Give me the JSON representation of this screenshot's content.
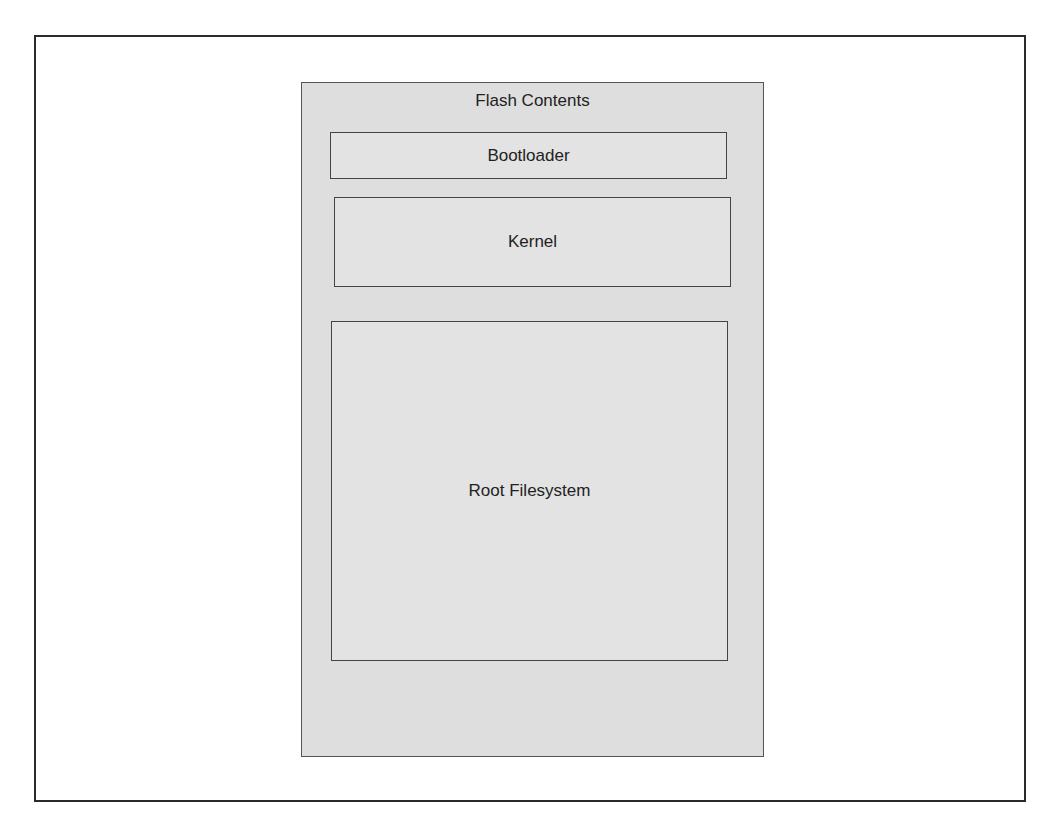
{
  "diagram": {
    "title": "Flash Contents",
    "blocks": [
      {
        "label": "Bootloader"
      },
      {
        "label": "Kernel"
      },
      {
        "label": "Root Filesystem"
      }
    ]
  },
  "colors": {
    "panel_fill": "#dedede",
    "block_border": "#444444",
    "frame_border": "#2b2b2b"
  }
}
